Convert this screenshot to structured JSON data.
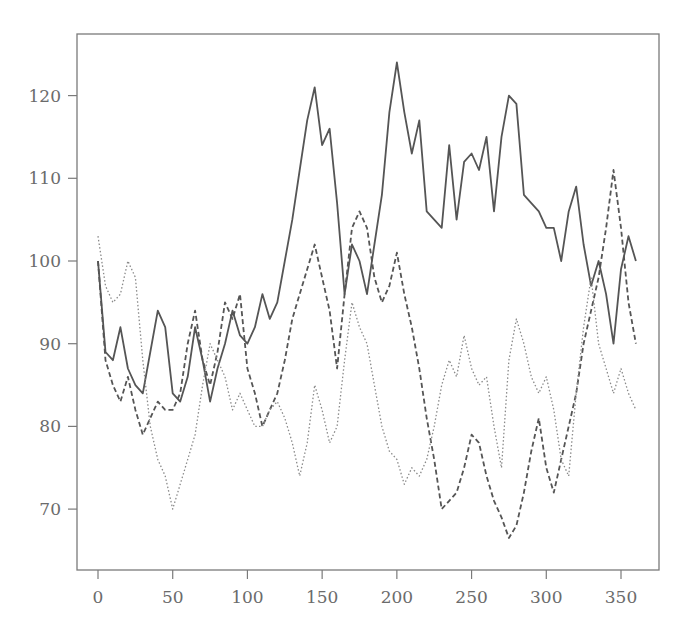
{
  "chart_data": {
    "type": "line",
    "title": "",
    "xlabel": "",
    "ylabel": "",
    "xlim": [
      -14,
      375
    ],
    "ylim": [
      62.6,
      127.4
    ],
    "grid": false,
    "legend": null,
    "xticks": [
      0,
      50,
      100,
      150,
      200,
      250,
      300,
      350
    ],
    "yticks": [
      70,
      80,
      90,
      100,
      110,
      120
    ],
    "x": [
      0,
      5,
      10,
      15,
      20,
      25,
      30,
      35,
      40,
      45,
      50,
      55,
      60,
      65,
      70,
      75,
      80,
      85,
      90,
      95,
      100,
      105,
      110,
      115,
      120,
      125,
      130,
      135,
      140,
      145,
      150,
      155,
      160,
      165,
      170,
      175,
      180,
      185,
      190,
      195,
      200,
      205,
      210,
      215,
      220,
      225,
      230,
      235,
      240,
      245,
      250,
      255,
      260,
      265,
      270,
      275,
      280,
      285,
      290,
      295,
      300,
      305,
      310,
      315,
      320,
      325,
      330,
      335,
      340,
      345,
      350,
      355,
      360
    ],
    "series": [
      {
        "name": "series-solid",
        "style": "solid",
        "color": "#555555",
        "values": [
          100,
          89,
          88,
          92,
          87,
          85,
          84,
          89,
          94,
          92,
          84,
          83,
          86,
          92,
          88,
          83,
          87,
          90,
          94,
          91,
          90,
          92,
          96,
          93,
          95,
          100,
          105,
          111,
          117,
          121,
          114,
          116,
          107,
          96,
          102,
          100,
          96,
          102,
          108,
          118,
          124,
          118,
          113,
          117,
          106,
          105,
          104,
          114,
          105,
          112,
          113,
          111,
          115,
          106,
          115,
          120,
          119,
          108,
          107,
          106,
          104,
          104,
          100,
          106,
          109,
          102,
          97,
          100,
          96,
          90,
          99,
          103,
          100
        ]
      },
      {
        "name": "series-dashed",
        "style": "dashed",
        "color": "#555555",
        "values": [
          100,
          88,
          85,
          83,
          86,
          82,
          79,
          81,
          83,
          82,
          82,
          84,
          90,
          94,
          88,
          85,
          89,
          95,
          93,
          96,
          87,
          84,
          80,
          82,
          84,
          88,
          93,
          96,
          99,
          102,
          98,
          94,
          87,
          96,
          104,
          106,
          104,
          98,
          95,
          97,
          101,
          96,
          92,
          87,
          81,
          76,
          70,
          71,
          72,
          75,
          79,
          78,
          74,
          71,
          69,
          66.5,
          68,
          72,
          77,
          81,
          75,
          72,
          76,
          80,
          84,
          90,
          94,
          98,
          104,
          111,
          104,
          95,
          90
        ]
      },
      {
        "name": "series-dotted",
        "style": "dotted",
        "color": "#8a8a8a",
        "values": [
          103,
          97,
          95,
          96,
          100,
          98,
          88,
          80,
          76,
          74,
          70,
          73,
          76,
          79,
          85,
          90,
          88,
          86,
          82,
          84,
          82,
          80,
          80,
          82,
          83,
          81,
          78,
          74,
          78,
          85,
          82,
          78,
          80,
          88,
          95,
          92,
          90,
          85,
          80,
          77,
          76,
          73,
          75,
          74,
          76,
          80,
          85,
          88,
          86,
          91,
          87,
          85,
          86,
          80,
          75,
          88,
          93,
          90,
          86,
          84,
          86,
          82,
          76,
          74,
          84,
          92,
          98,
          90,
          87,
          84,
          87,
          84,
          82
        ]
      }
    ]
  },
  "axes": {
    "x_tick_labels": [
      "0",
      "50",
      "100",
      "150",
      "200",
      "250",
      "300",
      "350"
    ],
    "y_tick_labels": [
      "70",
      "80",
      "90",
      "100",
      "110",
      "120"
    ]
  }
}
